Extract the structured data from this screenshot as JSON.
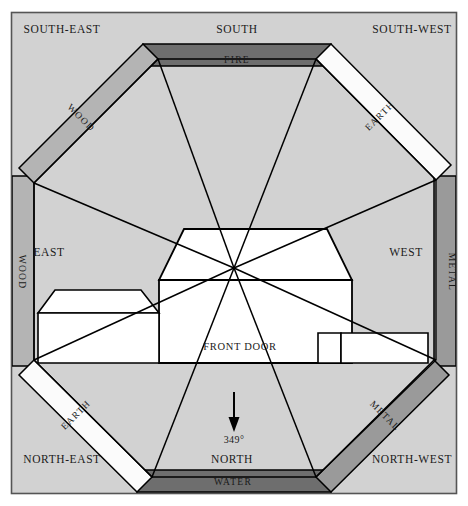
{
  "diagram": {
    "type": "octagonal-bagua-overlay",
    "width": 468,
    "height": 506
  },
  "colors": {
    "page_background": "#ffffff",
    "field_background": "#d2d2d2",
    "outer_frame_stroke": "#555555",
    "line_stroke": "#000000",
    "building_fill": "#ffffff",
    "fire_band": "#6e6e6e",
    "water_band": "#6e6e6e",
    "wood_band": "#b4b4b4",
    "metal_band": "#9a9a9a",
    "earth_band": "#fbfbfb",
    "text": "#1a1a1a"
  },
  "compass": {
    "directions": [
      {
        "id": "south-east",
        "label": "SOUTH-EAST",
        "x": 62,
        "y": 33
      },
      {
        "id": "south",
        "label": "SOUTH",
        "x": 237,
        "y": 33
      },
      {
        "id": "south-west",
        "label": "SOUTH-WEST",
        "x": 412,
        "y": 33
      },
      {
        "id": "east",
        "label": "EAST",
        "x": 49,
        "y": 256
      },
      {
        "id": "west",
        "label": "WEST",
        "x": 406,
        "y": 256
      },
      {
        "id": "north-east",
        "label": "NORTH-EAST",
        "x": 62,
        "y": 463
      },
      {
        "id": "north",
        "label": "NORTH",
        "x": 232,
        "y": 463
      },
      {
        "id": "north-west",
        "label": "NORTH-WEST",
        "x": 412,
        "y": 463
      }
    ]
  },
  "elements": {
    "bands": [
      {
        "id": "fire",
        "label": "FIRE",
        "direction": "south",
        "shade": "dark",
        "rotation": 0,
        "x": 237,
        "y": 59
      },
      {
        "id": "water",
        "label": "WATER",
        "direction": "north",
        "shade": "dark",
        "rotation": 0,
        "x": 233,
        "y": 492
      },
      {
        "id": "wood-se",
        "label": "WOOD",
        "direction": "south-east",
        "shade": "medium",
        "rotation": 45,
        "x": 79,
        "y": 120
      },
      {
        "id": "wood-e",
        "label": "WOOD",
        "direction": "east",
        "shade": "medium",
        "rotation": 90,
        "x": 15,
        "y": 272
      },
      {
        "id": "earth-sw",
        "label": "EARTH",
        "direction": "south-west",
        "shade": "light",
        "rotation": -45,
        "x": 382,
        "y": 118
      },
      {
        "id": "metal-w",
        "label": "METAL",
        "direction": "west",
        "shade": "medium-dark",
        "rotation": 90,
        "x": 452,
        "y": 272
      },
      {
        "id": "earth-ne",
        "label": "EARTH",
        "direction": "north-east",
        "shade": "light",
        "rotation": -45,
        "x": 78,
        "y": 417
      },
      {
        "id": "metal-nw",
        "label": "METAL",
        "direction": "north-west",
        "shade": "medium-dark",
        "rotation": 45,
        "x": 383,
        "y": 418
      }
    ]
  },
  "building": {
    "front_door_label": "FRONT DOOR",
    "front_door_x": 240,
    "front_door_y": 350
  },
  "orientation": {
    "bearing_label": "349°",
    "bearing_value": 349,
    "bearing_x": 234,
    "bearing_y": 440,
    "arrow_direction": "down",
    "arrow_from_y": 392,
    "arrow_to_y": 428
  }
}
